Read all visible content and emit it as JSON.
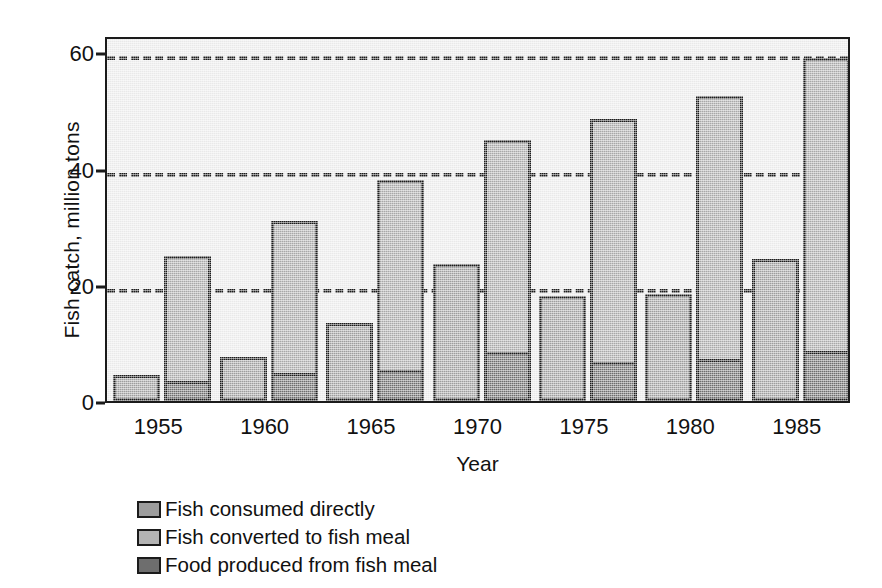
{
  "chart_data": {
    "type": "bar",
    "title": "",
    "subtitle": "",
    "xlabel": "Year",
    "ylabel": "Fish catch, million tons",
    "categories": [
      "1955",
      "1960",
      "1965",
      "1970",
      "1975",
      "1980",
      "1985"
    ],
    "ylim": [
      0,
      63
    ],
    "yticks": [
      0,
      20,
      40,
      60
    ],
    "ytick_labels": [
      "0",
      "20",
      "40",
      "60"
    ],
    "grid": "horizontal-dashed",
    "legend_position": "below-axes-left",
    "series": [
      {
        "name": "Fish consumed directly",
        "color": "#9d9d9d",
        "values": [
          4.5,
          7.5,
          13.5,
          23.5,
          18.0,
          18.5,
          24.5
        ]
      },
      {
        "name": "Fish converted to fish meal",
        "color": "#a8a8a8",
        "values": [
          25.0,
          31.0,
          38.0,
          45.0,
          48.5,
          52.5,
          59.0
        ]
      },
      {
        "name": "Food produced from fish meal",
        "color": "#6e6e6e",
        "values": [
          3.5,
          4.8,
          5.4,
          8.5,
          6.8,
          7.2,
          8.6
        ]
      }
    ]
  },
  "axes": {
    "ylabel": "Fish catch, million tons",
    "xlabel": "Year",
    "ytick_labels": [
      "60",
      "40",
      "20",
      "0"
    ],
    "xtick_labels": [
      "1955",
      "1960",
      "1965",
      "1970",
      "1975",
      "1980",
      "1985"
    ]
  },
  "legend": {
    "items": [
      {
        "label": "Fish consumed directly",
        "color": "#9d9d9d"
      },
      {
        "label": "Fish converted to fish meal",
        "color": "#b4b4b4"
      },
      {
        "label": "Food produced from fish meal",
        "color": "#6e6e6e"
      }
    ]
  },
  "colors": {
    "plot_background": "#e9e9e9",
    "axis": "#1b1b1b",
    "consumed_directly": "#9d9d9d",
    "converted_to_meal": "#a8a8a8",
    "food_from_meal": "#6e6e6e"
  }
}
